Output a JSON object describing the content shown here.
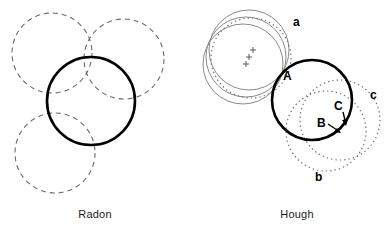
{
  "figure": {
    "width": 391,
    "height": 233,
    "background": "#ffffff"
  },
  "panels": [
    {
      "id": "radon",
      "caption": "Radon",
      "description": "Solid circle with three dashed circles of equal radius tangent-overlapping around it"
    },
    {
      "id": "hough",
      "caption": "Hough",
      "description": "Solid circle with three gray concentric-offset circles at left, dotted accumulator circles at right, plus markers and labels"
    }
  ],
  "colors": {
    "solid_stroke": "#000000",
    "dashed_stroke": "#6b6b6b",
    "gray_stroke": "#808080",
    "dotted_stroke": "#737373",
    "text": "#000000",
    "caption_text": "#1a1a1a"
  },
  "radon": {
    "caption": "Radon",
    "solid_circle": {
      "cx": 91,
      "cy": 101,
      "r": 44
    },
    "dashed_circles": [
      {
        "id": "top-left",
        "cx": 52,
        "cy": 53,
        "r": 40
      },
      {
        "id": "top-right",
        "cx": 124,
        "cy": 59,
        "r": 40
      },
      {
        "id": "bottom-left",
        "cx": 55,
        "cy": 153,
        "r": 40
      }
    ]
  },
  "hough": {
    "caption": "Hough",
    "solid_circle": {
      "cx": 312,
      "cy": 100,
      "r": 40
    },
    "gray_circles": [
      {
        "cx": 249,
        "cy": 50,
        "r": 40
      },
      {
        "cx": 246,
        "cy": 57,
        "r": 40
      },
      {
        "cx": 243,
        "cy": 64,
        "r": 40
      }
    ],
    "plus_markers": [
      {
        "x": 253,
        "y": 50
      },
      {
        "x": 249,
        "y": 57
      },
      {
        "x": 246,
        "y": 64
      }
    ],
    "dotted_circles": [
      {
        "id": "a",
        "cx": 251,
        "cy": 58,
        "r": 40
      },
      {
        "id": "b",
        "cx": 330,
        "cy": 130,
        "r": 40
      },
      {
        "id": "c",
        "cx": 340,
        "cy": 120,
        "r": 40
      }
    ],
    "labels": [
      {
        "text": "a",
        "x": 296,
        "y": 26,
        "kind": "lower"
      },
      {
        "text": "b",
        "x": 318,
        "y": 180,
        "kind": "lower"
      },
      {
        "text": "c",
        "x": 373,
        "y": 99,
        "kind": "lower"
      },
      {
        "text": "A",
        "x": 285,
        "y": 80,
        "kind": "upper"
      },
      {
        "text": "B",
        "x": 320,
        "y": 125,
        "kind": "upper"
      },
      {
        "text": "C",
        "x": 337,
        "y": 110,
        "kind": "upper"
      }
    ],
    "arrows": [
      {
        "from_label": "B",
        "x1": 329,
        "y1": 126,
        "x2": 340,
        "y2": 133
      },
      {
        "from_label": "C",
        "x1": 342,
        "y1": 113,
        "x2": 345,
        "y2": 126
      }
    ]
  }
}
